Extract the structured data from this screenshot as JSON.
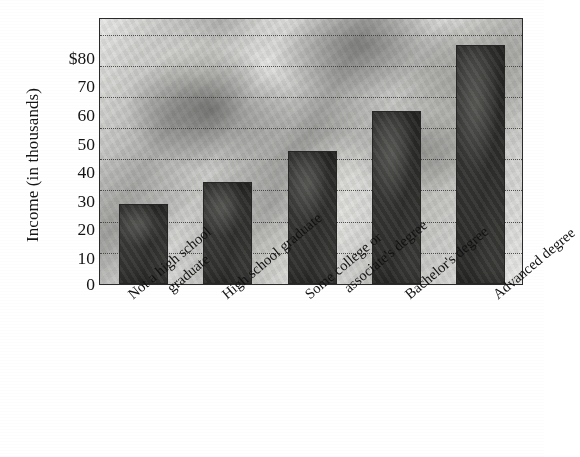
{
  "chart_data": {
    "type": "bar",
    "title": "",
    "subtitle": "",
    "xlabel": "",
    "ylabel": "Income (in thousands)",
    "categories": [
      "Not a high school graduate",
      "High school graduate",
      "Some college or associate's degree",
      "Bachelor's degree",
      "Advanced degree"
    ],
    "category_lines": [
      [
        "Not a high school",
        "graduate"
      ],
      [
        "High school graduate",
        ""
      ],
      [
        "Some college or",
        "associate's degree"
      ],
      [
        "Bachelor's degree",
        ""
      ],
      [
        "Advanced degree",
        ""
      ]
    ],
    "values": [
      25,
      32,
      42,
      55,
      76
    ],
    "ylim": [
      0,
      85
    ],
    "yticks": [
      0,
      10,
      20,
      30,
      40,
      50,
      60,
      70,
      80
    ],
    "ytick_labels": [
      "0",
      "10",
      "20",
      "30",
      "40",
      "50",
      "60",
      "70",
      "$80"
    ],
    "grid": true,
    "grid_style": "dotted-horizontal",
    "legend": "none",
    "bar_color": "#3a3a38",
    "plot_background": "photo-collage-grayscale",
    "units": "thousands of dollars"
  },
  "axis": {
    "y_title": "Income (in thousands)"
  }
}
